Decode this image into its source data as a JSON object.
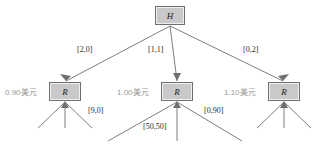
{
  "diagram": {
    "type": "game-tree",
    "root": {
      "id": "node-root",
      "label": "H"
    },
    "children": [
      {
        "id": "node-r-left",
        "label": "R",
        "price_label": "0.90美元",
        "edge_label": "[2,0]",
        "sub_edge_label": "",
        "leaf_count": 3
      },
      {
        "id": "node-r-mid",
        "label": "R",
        "price_label": "1.00美元",
        "edge_label": "[1,1]",
        "sub_edge_label": "[50,50]",
        "leaf_count": 3
      },
      {
        "id": "node-r-right",
        "label": "R",
        "price_label": "1.10美元",
        "edge_label": "[0,2]",
        "sub_edge_label": "",
        "leaf_count": 3
      }
    ],
    "sub_edge_labels": {
      "left": "[9,0]",
      "middle": "[50,50]",
      "right": "[0,90]"
    },
    "colors": {
      "node_fill": "#c9c9c9",
      "node_border": "#707070",
      "edge_stroke": "#6f6f6f",
      "label_text": "#2b2b2b",
      "price_text": "#9a9a9a",
      "background": "#ffffff"
    }
  }
}
